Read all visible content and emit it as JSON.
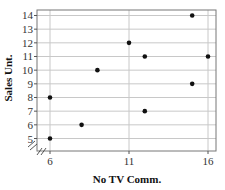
{
  "chart_data": {
    "type": "scatter",
    "title": "",
    "xlabel": "No TV Comm.",
    "ylabel": "Sales Unt.",
    "x_ticks": [
      6,
      11,
      16
    ],
    "y_ticks": [
      5,
      6,
      7,
      8,
      9,
      10,
      11,
      12,
      13,
      14
    ],
    "xlim": [
      5.2,
      16.5
    ],
    "ylim": [
      4.3,
      14.4
    ],
    "grid": true,
    "axis_break": {
      "x": true,
      "y": true
    },
    "legend": null,
    "points": [
      {
        "x": 6,
        "y": 5
      },
      {
        "x": 6,
        "y": 8
      },
      {
        "x": 8,
        "y": 6
      },
      {
        "x": 9,
        "y": 10
      },
      {
        "x": 11,
        "y": 12
      },
      {
        "x": 12,
        "y": 11
      },
      {
        "x": 12,
        "y": 7
      },
      {
        "x": 15,
        "y": 14
      },
      {
        "x": 15,
        "y": 9
      },
      {
        "x": 16,
        "y": 11
      }
    ]
  },
  "style": {
    "point_color": "#111111",
    "grid_color": "#c8c8c8",
    "axis_color": "#555555"
  }
}
